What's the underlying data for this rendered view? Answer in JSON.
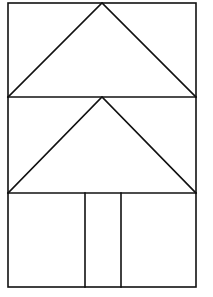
{
  "figure": {
    "stroke_color": "#111111",
    "background_color": "#ffffff",
    "outer_rect": {
      "x1": 8,
      "y1": 3,
      "x2": 196,
      "y2": 287
    },
    "dividers_y": [
      97,
      193
    ],
    "triangles": [
      {
        "name": "upper-triangle",
        "points": [
          [
            8,
            97
          ],
          [
            102,
            3
          ],
          [
            196,
            97
          ]
        ]
      },
      {
        "name": "lower-triangle",
        "points": [
          [
            8,
            193
          ],
          [
            102,
            97
          ],
          [
            196,
            193
          ]
        ]
      }
    ],
    "trunk_lines_x": [
      85,
      121
    ],
    "trunk_y": [
      193,
      287
    ]
  }
}
